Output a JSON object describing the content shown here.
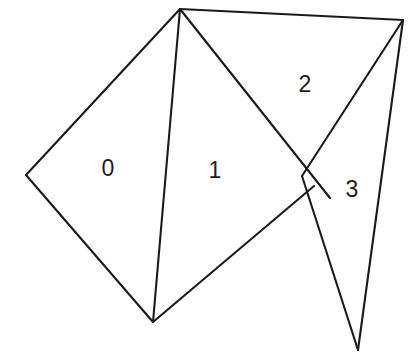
{
  "figure": {
    "kind": "triangle-mesh-diagram",
    "width": 418,
    "height": 361,
    "background_color": "#ffffff",
    "line_color": "#1a1a1a",
    "line_width": 2.1,
    "label_color": "#1d1d1d",
    "label_font_size": 23
  },
  "vertices": [
    {
      "name": "apex",
      "x": 180,
      "y": 9
    },
    {
      "name": "top-right",
      "x": 403,
      "y": 20
    },
    {
      "name": "left",
      "x": 26,
      "y": 175
    },
    {
      "name": "junction",
      "x": 314,
      "y": 186
    },
    {
      "name": "bottom",
      "x": 153,
      "y": 322
    },
    {
      "name": "spike",
      "x": 358,
      "y": 350
    }
  ],
  "edges": [
    {
      "name": "apex-left",
      "x1": 180,
      "y1": 9,
      "x2": 26,
      "y2": 175
    },
    {
      "name": "left-bottom",
      "x1": 26,
      "y1": 175,
      "x2": 153,
      "y2": 322
    },
    {
      "name": "apex-bottom",
      "x1": 180,
      "y1": 9,
      "x2": 153,
      "y2": 322
    },
    {
      "name": "bottom-junction",
      "x1": 153,
      "y1": 322,
      "x2": 314,
      "y2": 186
    },
    {
      "name": "apex-junction",
      "x1": 180,
      "y1": 9,
      "x2": 330,
      "y2": 198
    },
    {
      "name": "apex-topright",
      "x1": 180,
      "y1": 9,
      "x2": 403,
      "y2": 20
    },
    {
      "name": "topright-junction",
      "x1": 403,
      "y1": 20,
      "x2": 302,
      "y2": 176
    },
    {
      "name": "junction-spike",
      "x1": 302,
      "y1": 176,
      "x2": 358,
      "y2": 350
    },
    {
      "name": "topright-spike",
      "x1": 403,
      "y1": 20,
      "x2": 358,
      "y2": 350
    }
  ],
  "faces": [
    {
      "id": "0",
      "label": "0",
      "label_x": 108,
      "label_y": 168
    },
    {
      "id": "1",
      "label": "1",
      "label_x": 215,
      "label_y": 170
    },
    {
      "id": "2",
      "label": "2",
      "label_x": 305,
      "label_y": 84
    },
    {
      "id": "3",
      "label": "3",
      "label_x": 352,
      "label_y": 189
    }
  ]
}
